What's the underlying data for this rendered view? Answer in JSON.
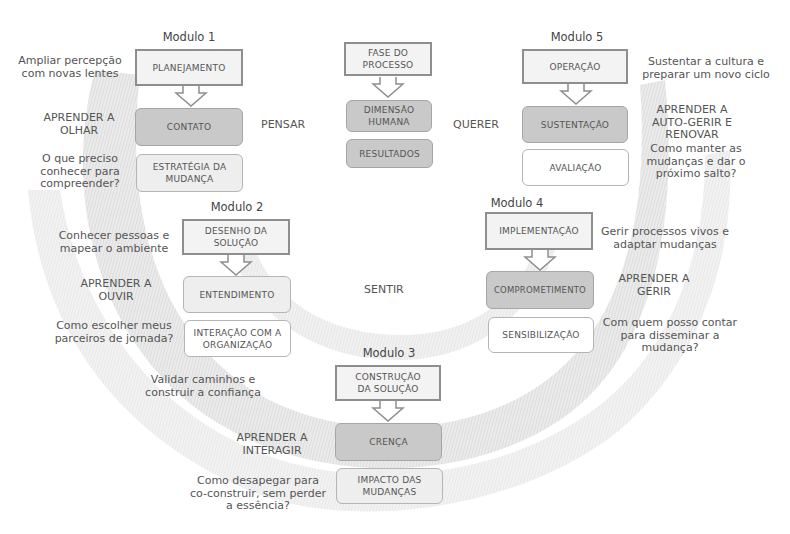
{
  "legend": {
    "phase": "FASE DO PROCESSO",
    "human": "DIMENSÃO HUMANA",
    "results": "RESULTADOS"
  },
  "dimensions": {
    "left": "PENSAR",
    "center": "SENTIR",
    "right": "QUERER"
  },
  "modules": [
    {
      "title": "Modulo 1",
      "phase": "PLANEJAMENTO",
      "human": "CONTATO",
      "result": "ESTRATÉGIA DA MUDANÇA",
      "goal": "Ampliar percepção com novas lentes",
      "learn": "APRENDER A OLHAR",
      "question": "O que preciso conhecer para compreender?"
    },
    {
      "title": "Modulo 2",
      "phase": "DESENHO DA SOLUÇÃO",
      "human": "ENTENDIMENTO",
      "result": "INTERAÇÃO COM A ORGANIZAÇÃO",
      "goal": "Conhecer pessoas e mapear o ambiente",
      "learn": "APRENDER A OUVIR",
      "question": "Como escolher meus parceiros de jornada?"
    },
    {
      "title": "Modulo 3",
      "phase": "CONSTRUÇÃO DA SOLUÇÃO",
      "human": "CRENÇA",
      "result": "IMPACTO DAS MUDANÇAS",
      "goal": "Validar caminhos e construir a confiança",
      "learn": "APRENDER A INTERAGIR",
      "question": "Como desapegar para co-construir, sem perder a essência?"
    },
    {
      "title": "Modulo 4",
      "phase": "IMPLEMENTAÇÃO",
      "human": "COMPROMETIMENTO",
      "result": "SENSIBILIZAÇÃO",
      "goal": "Gerir processos vivos e adaptar mudanças",
      "learn": "APRENDER A GERIR",
      "question": "Com quem posso contar para disseminar a mudança?"
    },
    {
      "title": "Modulo 5",
      "phase": "OPERAÇÃO",
      "human": "SUSTENTAÇÃO",
      "result": "AVALIAÇÃO",
      "goal": "Sustentar a cultura e preparar um novo ciclo",
      "learn": "APRENDER A AUTO-GERIR E RENOVAR",
      "question": "Como manter as mudanças e dar o próximo salto?"
    }
  ],
  "colors": {
    "phase_fill": "#f3f3f3",
    "phase_border": "#8e8e8e",
    "human_fill": "#c9c9c9",
    "result_fill": "#eeeeee",
    "swoosh": "#e4e4e4",
    "text": "#555555"
  }
}
